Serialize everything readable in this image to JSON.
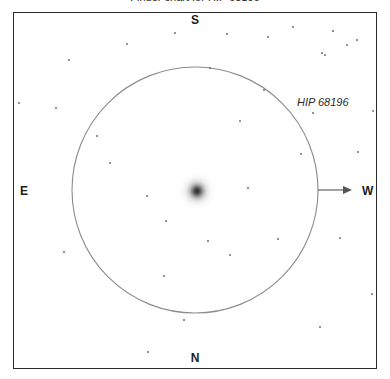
{
  "chart": {
    "title": "Finder chart for HIP 68196",
    "type": "finder-chart",
    "width": 390,
    "height": 379,
    "background_color": "#ffffff",
    "frame": {
      "x": 13,
      "y": 12,
      "width": 364,
      "height": 357,
      "border_color": "#2b2b2b",
      "border_width": 1
    }
  },
  "cardinals": {
    "north": "N",
    "south": "S",
    "east": "E",
    "west": "W"
  },
  "object": {
    "label": "HIP 68196",
    "label_x": 297,
    "label_y": 97,
    "center_x": 197,
    "center_y": 191,
    "appearance": "diffuse-gradient-blob",
    "core_color": "#141414"
  },
  "fov_circle": {
    "center_x": 195,
    "center_y": 190,
    "radius": 123,
    "stroke_color": "#8c8c8c",
    "stroke_width": 1.1
  },
  "direction_arrow": {
    "from_x": 318,
    "from_y": 190,
    "to_x": 352,
    "to_y": 190,
    "points_to": "W",
    "color": "#555555"
  },
  "chart_data": {
    "type": "scatter",
    "title": "Finder chart for HIP 68196",
    "xlabel": "",
    "ylabel": "",
    "xlim": [
      13,
      377
    ],
    "ylim": [
      12,
      369
    ],
    "grid": false,
    "legend": null,
    "annotations": [
      {
        "text": "HIP 68196",
        "x": 297,
        "y": 97,
        "style": "italic"
      },
      {
        "text": "S",
        "x": 195,
        "y": 20,
        "style": "bold"
      },
      {
        "text": "N",
        "x": 195,
        "y": 358,
        "style": "bold"
      },
      {
        "text": "E",
        "x": 22,
        "y": 191,
        "style": "bold"
      },
      {
        "text": "W",
        "x": 366,
        "y": 191,
        "style": "bold"
      }
    ],
    "series": [
      {
        "name": "target",
        "marker": "diffuse",
        "points": [
          {
            "x": 197,
            "y": 191,
            "size": 40
          }
        ]
      },
      {
        "name": "field-stars",
        "marker": "dot",
        "points": [
          {
            "x": 56,
            "y": 108,
            "size": 1.3
          },
          {
            "x": 97,
            "y": 136,
            "size": 1.6
          },
          {
            "x": 19,
            "y": 103,
            "size": 1.2
          },
          {
            "x": 127,
            "y": 44,
            "size": 1.3
          },
          {
            "x": 175,
            "y": 33,
            "size": 1.2
          },
          {
            "x": 227,
            "y": 34,
            "size": 1.5
          },
          {
            "x": 268,
            "y": 37,
            "size": 1.3
          },
          {
            "x": 293,
            "y": 27,
            "size": 1.2
          },
          {
            "x": 333,
            "y": 31,
            "size": 1.7
          },
          {
            "x": 347,
            "y": 45,
            "size": 1.3
          },
          {
            "x": 357,
            "y": 40,
            "size": 1.2
          },
          {
            "x": 322,
            "y": 53,
            "size": 1.2
          },
          {
            "x": 325,
            "y": 55,
            "size": 1.1
          },
          {
            "x": 264,
            "y": 90,
            "size": 1.4
          },
          {
            "x": 313,
            "y": 113,
            "size": 1.5
          },
          {
            "x": 373,
            "y": 111,
            "size": 1.3
          },
          {
            "x": 301,
            "y": 154,
            "size": 1.3
          },
          {
            "x": 110,
            "y": 163,
            "size": 1.2
          },
          {
            "x": 248,
            "y": 188,
            "size": 1.4
          },
          {
            "x": 166,
            "y": 221,
            "size": 1.2
          },
          {
            "x": 208,
            "y": 241,
            "size": 1.6
          },
          {
            "x": 358,
            "y": 152,
            "size": 1.3
          },
          {
            "x": 230,
            "y": 255,
            "size": 1.3
          },
          {
            "x": 164,
            "y": 276,
            "size": 1.4
          },
          {
            "x": 278,
            "y": 239,
            "size": 1.2
          },
          {
            "x": 340,
            "y": 238,
            "size": 1.4
          },
          {
            "x": 184,
            "y": 320,
            "size": 1.5
          },
          {
            "x": 148,
            "y": 352,
            "size": 1.4
          },
          {
            "x": 320,
            "y": 327,
            "size": 1.4
          },
          {
            "x": 372,
            "y": 294,
            "size": 1.2
          },
          {
            "x": 147,
            "y": 196,
            "size": 1.1
          },
          {
            "x": 64,
            "y": 252,
            "size": 1.2
          },
          {
            "x": 69,
            "y": 60,
            "size": 1.1
          },
          {
            "x": 240,
            "y": 121,
            "size": 1.1
          },
          {
            "x": 210,
            "y": 68,
            "size": 1.1
          }
        ]
      }
    ]
  }
}
